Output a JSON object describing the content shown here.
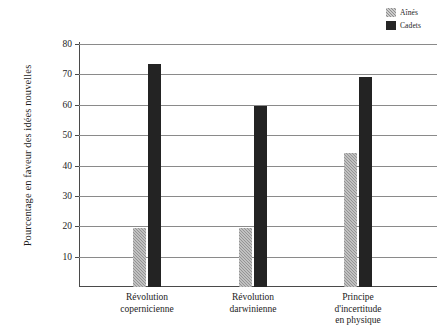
{
  "chart_data": {
    "type": "bar",
    "title": "",
    "xlabel": "",
    "ylabel": "Pourcentage en faveur des idées nouvelles",
    "ylim": [
      0,
      80
    ],
    "ytick_labels": [
      "80",
      "70",
      "60",
      "50",
      "40",
      "30",
      "20",
      "10"
    ],
    "yticks": [
      80,
      70,
      60,
      50,
      40,
      30,
      20,
      10
    ],
    "grid": true,
    "legend_position": "top-right",
    "categories": [
      "Révolution copernicienne",
      "Révolution darwinienne",
      "Principe d'incertitude en physique"
    ],
    "category_lines": [
      [
        "Révolution",
        "copernicienne"
      ],
      [
        "Révolution",
        "darwinienne"
      ],
      [
        "Principe",
        "d'incertitude",
        "en physique"
      ]
    ],
    "series": [
      {
        "name": "Aînés",
        "color": "#949494",
        "values": [
          19.5,
          19.5,
          44
        ]
      },
      {
        "name": "Cadets",
        "color": "#232323",
        "values": [
          73.5,
          59.5,
          69
        ]
      }
    ]
  },
  "legend": {
    "items": [
      {
        "label": "Aînés"
      },
      {
        "label": "Cadets"
      }
    ]
  },
  "axis": {
    "y_title": "Pourcentage en faveur des idées nouvelles"
  }
}
